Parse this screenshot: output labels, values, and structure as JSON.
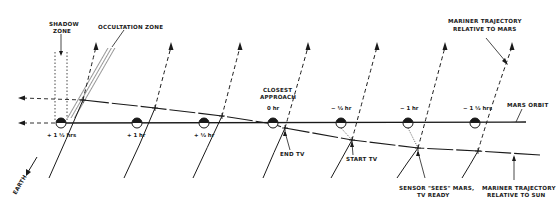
{
  "diagram": {
    "labels": {
      "shadow_zone_line1": "SHADOW",
      "shadow_zone_line2": "ZONE",
      "occultation_zone": "OCCULTATION ZONE",
      "closest_approach_line1": "CLOSEST",
      "closest_approach_line2": "APPROACH",
      "mariner_mars_line1": "MARINER TRAJECTORY",
      "mariner_mars_line2": "RELATIVE TO MARS",
      "mars_orbit": "MARS ORBIT",
      "end_tv": "END TV",
      "start_tv": "START TV",
      "sensor_line1": "SENSOR \"SEES\" MARS,",
      "sensor_line2": "TV READY",
      "mariner_sun_line1": "MARINER TRAJECTORY",
      "mariner_sun_line2": "RELATIVE TO SUN",
      "earth": "EARTH"
    },
    "time_marks": [
      {
        "label": "+ 1 ½ hrs",
        "x": 61
      },
      {
        "label": "+ 1 hr",
        "x": 137
      },
      {
        "label": "+ ½ hr",
        "x": 204
      },
      {
        "label": "0 hr",
        "x": 273
      },
      {
        "label": "− ½ hr",
        "x": 341
      },
      {
        "label": "− 1 hr",
        "x": 408
      },
      {
        "label": "− 1 ½ hrs",
        "x": 475
      }
    ],
    "colors": {
      "ink": "#1a1a1a",
      "background": "#ffffff"
    }
  }
}
